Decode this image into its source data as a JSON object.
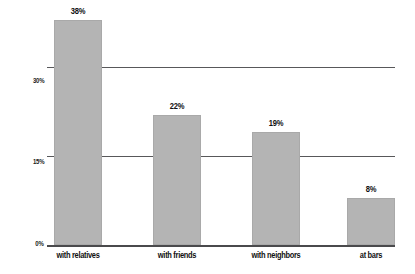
{
  "chart_data": {
    "type": "bar",
    "title": "",
    "subtitle": "",
    "xlabel": "",
    "ylabel": "",
    "categories": [
      "with relatives",
      "with friends",
      "with neighbors",
      "at bars"
    ],
    "values": [
      38,
      22,
      19,
      8
    ],
    "value_labels": [
      "38%",
      "22%",
      "19%",
      "8%"
    ],
    "ylim": [
      0,
      39
    ],
    "yticks": [
      0,
      15,
      30
    ],
    "ytick_labels": [
      "0%",
      "15%",
      "30%"
    ],
    "grid": "horizontal-at-yticks",
    "legend": "none",
    "series": [
      {
        "name": "",
        "values": [
          38,
          22,
          19,
          8
        ]
      }
    ],
    "colors": {
      "bar_fill": "#b4b4b4",
      "bar_edge": "#a9a9a9",
      "gridline": "#58585a",
      "axis": "#4a4a4c",
      "text": "#111111",
      "background": "#ffffff"
    }
  }
}
